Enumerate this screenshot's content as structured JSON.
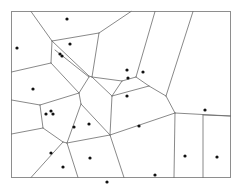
{
  "figure": {
    "kind": "voronoi-diagram",
    "title": "",
    "caption": "",
    "width": 242,
    "height": 192,
    "background_color": "#ffffff"
  },
  "frame": {
    "x": 11.5,
    "y": 11.5,
    "width": 219,
    "height": 166,
    "stroke_color": "#8e8e8e",
    "stroke_width": 1,
    "fill_color": "#ffffff"
  },
  "style": {
    "edge_color": "#6b6b6b",
    "edge_width": 0.8,
    "point_color": "#111111",
    "point_radius": 1.6
  },
  "chart_data": {
    "type": "scatter",
    "title": "",
    "xlabel": "",
    "ylabel": "",
    "xlim": [
      11.5,
      230.5
    ],
    "ylim": [
      11.5,
      177.5
    ],
    "grid": false,
    "legend": false,
    "seed_count": 24,
    "edge_count": 40,
    "points": [
      {
        "id": 1,
        "x": 67,
        "y": 19
      },
      {
        "id": 2,
        "x": 17,
        "y": 48
      },
      {
        "id": 3,
        "x": 70,
        "y": 44
      },
      {
        "id": 4,
        "x": 60,
        "y": 54
      },
      {
        "id": 5,
        "x": 62,
        "y": 56
      },
      {
        "id": 6,
        "x": 127,
        "y": 70
      },
      {
        "id": 7,
        "x": 128,
        "y": 78
      },
      {
        "id": 8,
        "x": 143,
        "y": 72
      },
      {
        "id": 9,
        "x": 33,
        "y": 89
      },
      {
        "id": 10,
        "x": 127,
        "y": 96
      },
      {
        "id": 11,
        "x": 205,
        "y": 110
      },
      {
        "id": 12,
        "x": 46,
        "y": 114
      },
      {
        "id": 13,
        "x": 51,
        "y": 111
      },
      {
        "id": 14,
        "x": 53,
        "y": 114
      },
      {
        "id": 15,
        "x": 74,
        "y": 127
      },
      {
        "id": 16,
        "x": 89,
        "y": 124
      },
      {
        "id": 17,
        "x": 139,
        "y": 126
      },
      {
        "id": 18,
        "x": 51,
        "y": 153
      },
      {
        "id": 19,
        "x": 63,
        "y": 167
      },
      {
        "id": 20,
        "x": 90,
        "y": 158
      },
      {
        "id": 21,
        "x": 185,
        "y": 156
      },
      {
        "id": 22,
        "x": 217,
        "y": 157
      },
      {
        "id": 23,
        "x": 155,
        "y": 175
      },
      {
        "id": 24,
        "x": 107,
        "y": 182
      }
    ],
    "edges": [
      {
        "id": "e01",
        "x1": 31,
        "y1": 11.5,
        "x2": 52,
        "y2": 41
      },
      {
        "id": "e02",
        "x1": 52,
        "y1": 41,
        "x2": 99,
        "y2": 33
      },
      {
        "id": "e03",
        "x1": 99,
        "y1": 33,
        "x2": 131,
        "y2": 11.5
      },
      {
        "id": "e04",
        "x1": 52,
        "y1": 41,
        "x2": 51,
        "y2": 63
      },
      {
        "id": "e05",
        "x1": 52,
        "y1": 41,
        "x2": 89,
        "y2": 76
      },
      {
        "id": "e06",
        "x1": 55,
        "y1": 50,
        "x2": 89,
        "y2": 77
      },
      {
        "id": "e07",
        "x1": 99,
        "y1": 33,
        "x2": 92,
        "y2": 77
      },
      {
        "id": "e08",
        "x1": 92,
        "y1": 77,
        "x2": 89,
        "y2": 76
      },
      {
        "id": "e09",
        "x1": 11.5,
        "y1": 72,
        "x2": 51,
        "y2": 63
      },
      {
        "id": "e10",
        "x1": 51,
        "y1": 63,
        "x2": 79,
        "y2": 93
      },
      {
        "id": "e11",
        "x1": 89,
        "y1": 77,
        "x2": 79,
        "y2": 93
      },
      {
        "id": "e12",
        "x1": 92,
        "y1": 77,
        "x2": 122,
        "y2": 81
      },
      {
        "id": "e13",
        "x1": 122,
        "y1": 81,
        "x2": 136,
        "y2": 77
      },
      {
        "id": "e14",
        "x1": 136,
        "y1": 77,
        "x2": 155,
        "y2": 11.5
      },
      {
        "id": "e15",
        "x1": 136,
        "y1": 77,
        "x2": 149,
        "y2": 86
      },
      {
        "id": "e16",
        "x1": 122,
        "y1": 81,
        "x2": 112,
        "y2": 96
      },
      {
        "id": "e17",
        "x1": 112,
        "y1": 96,
        "x2": 149,
        "y2": 86
      },
      {
        "id": "e18",
        "x1": 92,
        "y1": 77,
        "x2": 112,
        "y2": 96
      },
      {
        "id": "e19",
        "x1": 149,
        "y1": 86,
        "x2": 166,
        "y2": 96
      },
      {
        "id": "e20",
        "x1": 166,
        "y1": 96,
        "x2": 193,
        "y2": 11.5
      },
      {
        "id": "e21",
        "x1": 166,
        "y1": 96,
        "x2": 175,
        "y2": 113
      },
      {
        "id": "e22",
        "x1": 175,
        "y1": 113,
        "x2": 230.5,
        "y2": 116
      },
      {
        "id": "e23",
        "x1": 79,
        "y1": 93,
        "x2": 81,
        "y2": 104
      },
      {
        "id": "e24",
        "x1": 79,
        "y1": 93,
        "x2": 40,
        "y2": 105
      },
      {
        "id": "e25",
        "x1": 40,
        "y1": 105,
        "x2": 11.5,
        "y2": 100
      },
      {
        "id": "e26",
        "x1": 40,
        "y1": 105,
        "x2": 43,
        "y2": 128
      },
      {
        "id": "e27",
        "x1": 43,
        "y1": 128,
        "x2": 11.5,
        "y2": 134
      },
      {
        "id": "e28",
        "x1": 43,
        "y1": 128,
        "x2": 63,
        "y2": 142
      },
      {
        "id": "e29",
        "x1": 81,
        "y1": 104,
        "x2": 67,
        "y2": 143
      },
      {
        "id": "e30",
        "x1": 67,
        "y1": 143,
        "x2": 63,
        "y2": 142
      },
      {
        "id": "e31",
        "x1": 63,
        "y1": 142,
        "x2": 31,
        "y2": 177.5
      },
      {
        "id": "e32",
        "x1": 112,
        "y1": 96,
        "x2": 110,
        "y2": 135
      },
      {
        "id": "e33",
        "x1": 81,
        "y1": 104,
        "x2": 110,
        "y2": 135
      },
      {
        "id": "e34",
        "x1": 110,
        "y1": 135,
        "x2": 67,
        "y2": 143
      },
      {
        "id": "e35",
        "x1": 67,
        "y1": 143,
        "x2": 78,
        "y2": 177.5
      },
      {
        "id": "e36",
        "x1": 110,
        "y1": 135,
        "x2": 124,
        "y2": 177.5
      },
      {
        "id": "e37",
        "x1": 175,
        "y1": 113,
        "x2": 110,
        "y2": 135
      },
      {
        "id": "e38",
        "x1": 175,
        "y1": 113,
        "x2": 174,
        "y2": 177.5
      },
      {
        "id": "e39",
        "x1": 203,
        "y1": 115,
        "x2": 203,
        "y2": 177.5
      },
      {
        "id": "e40",
        "x1": 203,
        "y1": 115,
        "x2": 230.5,
        "y2": 116
      }
    ]
  }
}
